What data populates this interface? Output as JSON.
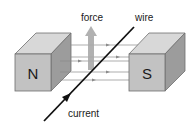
{
  "labels": {
    "force": "force",
    "wire": "wire",
    "current": "current"
  },
  "magnets": {
    "north": {
      "label": "N"
    },
    "south": {
      "label": "S"
    }
  },
  "colors": {
    "magnet_top": "#d8d8d8",
    "magnet_front": "#c2c2c2",
    "magnet_side": "#9c9c9c",
    "magnet_edge": "#6e6e6e",
    "field_line": "#8a8a8a",
    "force_arrow": "#a8a8a8",
    "wire": "#111111",
    "text": "#1a1a1a"
  }
}
